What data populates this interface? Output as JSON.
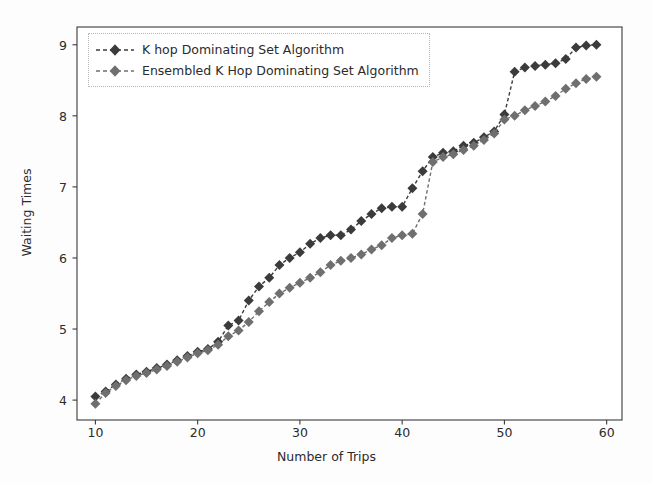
{
  "chart_data": {
    "type": "line",
    "title": "",
    "xlabel": "Number of Trips",
    "ylabel": "Waiting Times",
    "xlim": [
      8.2,
      61.5
    ],
    "ylim": [
      3.72,
      9.25
    ],
    "xticks": [
      10,
      20,
      30,
      40,
      50,
      60
    ],
    "yticks": [
      4,
      5,
      6,
      7,
      8,
      9
    ],
    "grid": false,
    "legend_position": "upper left",
    "marker": "diamond",
    "x": [
      10,
      11,
      12,
      13,
      14,
      15,
      16,
      17,
      18,
      19,
      20,
      21,
      22,
      23,
      24,
      25,
      26,
      27,
      28,
      29,
      30,
      31,
      32,
      33,
      34,
      35,
      36,
      37,
      38,
      39,
      40,
      41,
      42,
      43,
      44,
      45,
      46,
      47,
      48,
      49,
      50,
      51,
      52,
      53,
      54,
      55,
      56,
      57,
      58,
      59
    ],
    "series": [
      {
        "name": "K hop Dominating Set Algorithm",
        "color": "#3b3b3b",
        "values": [
          4.05,
          4.12,
          4.22,
          4.3,
          4.36,
          4.4,
          4.45,
          4.5,
          4.56,
          4.62,
          4.68,
          4.72,
          4.82,
          5.05,
          5.12,
          5.4,
          5.6,
          5.72,
          5.9,
          6.0,
          6.08,
          6.2,
          6.28,
          6.32,
          6.32,
          6.4,
          6.52,
          6.62,
          6.7,
          6.72,
          6.72,
          6.98,
          7.22,
          7.42,
          7.48,
          7.5,
          7.58,
          7.62,
          7.7,
          7.78,
          8.02,
          8.62,
          8.68,
          8.7,
          8.72,
          8.74,
          8.8,
          8.96,
          8.99,
          9.0
        ]
      },
      {
        "name": "Ensembled K Hop Dominating Set Algorithm",
        "color": "#6f6f6f",
        "values": [
          3.95,
          4.1,
          4.2,
          4.28,
          4.34,
          4.38,
          4.43,
          4.48,
          4.54,
          4.6,
          4.66,
          4.7,
          4.78,
          4.9,
          4.98,
          5.1,
          5.25,
          5.38,
          5.5,
          5.58,
          5.65,
          5.72,
          5.8,
          5.9,
          5.96,
          6.0,
          6.05,
          6.12,
          6.18,
          6.28,
          6.32,
          6.34,
          6.62,
          7.35,
          7.42,
          7.46,
          7.52,
          7.58,
          7.66,
          7.75,
          7.95,
          8.0,
          8.08,
          8.14,
          8.2,
          8.28,
          8.38,
          8.46,
          8.52,
          8.55
        ]
      }
    ]
  },
  "legend": {
    "entries": [
      {
        "label": "K hop Dominating Set Algorithm"
      },
      {
        "label": "Ensembled K Hop Dominating Set Algorithm"
      }
    ]
  },
  "axes": {
    "xlabel": "Number of Trips",
    "ylabel": "Waiting Times"
  }
}
